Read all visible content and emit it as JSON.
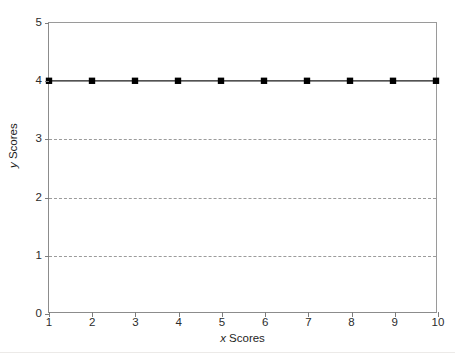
{
  "chart_data": {
    "type": "line",
    "title": "",
    "subtitle": "",
    "xlabel_variable": "x",
    "xlabel_text": " Scores",
    "xlabel": "x Scores",
    "ylabel_variable": "y",
    "ylabel_text": " Scores",
    "ylabel": "y Scores",
    "x": [
      1,
      2,
      3,
      4,
      5,
      6,
      7,
      8,
      9,
      10
    ],
    "values": [
      4,
      4,
      4,
      4,
      4,
      4,
      4,
      4,
      4,
      4
    ],
    "series": [
      {
        "name": "",
        "values": [
          4,
          4,
          4,
          4,
          4,
          4,
          4,
          4,
          4,
          4
        ],
        "marker": "square",
        "marker_color": "#000000",
        "line_color": "#1a1a1a"
      }
    ],
    "xlim": [
      1,
      10
    ],
    "ylim": [
      0,
      5
    ],
    "xticks": [
      1,
      2,
      3,
      4,
      5,
      6,
      7,
      8,
      9,
      10
    ],
    "xtick_labels": [
      "1",
      "2",
      "3",
      "4",
      "5",
      "6",
      "7",
      "8",
      "9",
      "10"
    ],
    "yticks": [
      0,
      1,
      2,
      3,
      4,
      5
    ],
    "ytick_labels": [
      "0",
      "1",
      "2",
      "3",
      "4",
      "5"
    ],
    "gridlines_y": [
      1,
      2,
      3
    ],
    "grid": "horizontal-dashed",
    "grid_color": "#9b9b9b",
    "axis_color": "#8c8c8c",
    "legend": "none",
    "legend_position": "none",
    "background": "#ffffff"
  }
}
